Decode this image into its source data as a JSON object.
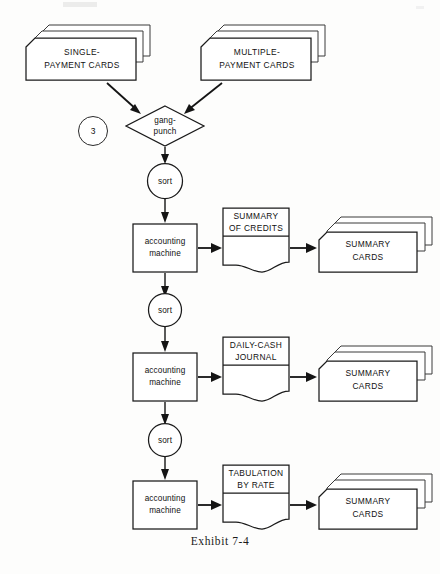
{
  "figure": {
    "caption": "Exhibit 7-4",
    "background_color": "#fdfdfc",
    "ink_color": "#141414"
  },
  "nodes": {
    "single_payment_cards": {
      "label_line1": "SINGLE-",
      "label_line2": "PAYMENT CARDS",
      "type": "punched-card-stack"
    },
    "multiple_payment_cards": {
      "label_line1": "MULTIPLE-",
      "label_line2": "PAYMENT CARDS",
      "type": "punched-card-stack"
    },
    "connector_3": {
      "label": "3",
      "type": "connector-circle"
    },
    "gang_punch": {
      "label_line1": "gang-",
      "label_line2": "punch",
      "type": "decision-diamond"
    },
    "sort_1": {
      "label": "sort",
      "type": "process-circle"
    },
    "sort_2": {
      "label": "sort",
      "type": "process-circle"
    },
    "sort_3": {
      "label": "sort",
      "type": "process-circle"
    },
    "accounting_machine_1": {
      "label_line1": "accounting",
      "label_line2": "machine",
      "type": "process-box"
    },
    "accounting_machine_2": {
      "label_line1": "accounting",
      "label_line2": "machine",
      "type": "process-box"
    },
    "accounting_machine_3": {
      "label_line1": "accounting",
      "label_line2": "machine",
      "type": "process-box"
    },
    "summary_of_credits": {
      "label_line1": "SUMMARY",
      "label_line2": "OF CREDITS",
      "type": "document"
    },
    "daily_cash_journal": {
      "label_line1": "DAILY-CASH",
      "label_line2": "JOURNAL",
      "type": "document"
    },
    "tabulation_by_rate": {
      "label_line1": "TABULATION",
      "label_line2": "BY RATE",
      "type": "document"
    },
    "summary_cards_1": {
      "label_line1": "SUMMARY",
      "label_line2": "CARDS",
      "type": "punched-card-stack"
    },
    "summary_cards_2": {
      "label_line1": "SUMMARY",
      "label_line2": "CARDS",
      "type": "punched-card-stack"
    },
    "summary_cards_3": {
      "label_line1": "SUMMARY",
      "label_line2": "CARDS",
      "type": "punched-card-stack"
    }
  }
}
